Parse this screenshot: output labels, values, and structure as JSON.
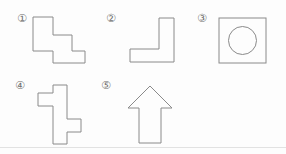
{
  "canvas": {
    "width": 286,
    "height": 154,
    "background_color": "#fdfdfd",
    "stroke_color": "#8a8a8a",
    "label_color": "#6f6f6f"
  },
  "divider": {
    "name": "baseline-rule",
    "y": 147,
    "color": "#e2e2e2"
  },
  "figures": [
    {
      "id": "figure-1",
      "label": "①",
      "label_text": "1",
      "shape_name": "staircase-polygon",
      "description": "Two-step staircase descending to the right",
      "label_x": 17,
      "label_y": 13,
      "origin_x": 33,
      "origin_y": 17,
      "view_width": 56,
      "view_height": 48,
      "points": "0,0 20,0 20,18 39,18 39,34 52,34 52,46 20,46 20,34 0,34"
    },
    {
      "id": "figure-2",
      "label": "②",
      "label_text": "2",
      "shape_name": "l-shape-polygon",
      "description": "L shape: tall vertical bar on the right with a horizontal foot extending left",
      "label_x": 106,
      "label_y": 13,
      "origin_x": 130,
      "origin_y": 18,
      "view_width": 48,
      "view_height": 46,
      "points": "29,0 44,0 44,44 0,44 0,31 29,31"
    },
    {
      "id": "figure-3",
      "label": "③",
      "label_text": "3",
      "shape_name": "square-with-circle",
      "description": "Square outline containing a centered circle",
      "label_x": 197,
      "label_y": 13,
      "origin_x": 219,
      "origin_y": 18,
      "view_width": 48,
      "view_height": 46,
      "square": {
        "x": 0,
        "y": 0,
        "width": 47,
        "height": 45
      },
      "circle": {
        "cx": 23.5,
        "cy": 22.5,
        "r": 14
      }
    },
    {
      "id": "figure-4",
      "label": "④",
      "label_text": "4",
      "shape_name": "offset-cross-polygon",
      "description": "Cross-like polygon with an arm on the upper left and an arm on the lower right",
      "label_x": 15,
      "label_y": 80,
      "origin_x": 38,
      "origin_y": 85,
      "view_width": 44,
      "view_height": 60,
      "points": "15,0 29,0 29,34 43,34 43,47 29,47 29,59 15,59 15,21 0,21 0,8 15,8"
    },
    {
      "id": "figure-5",
      "label": "⑤",
      "label_text": "5",
      "shape_name": "up-arrow-polygon",
      "description": "Upward pointing arrow with triangular head and rectangular shaft",
      "label_x": 101,
      "label_y": 80,
      "origin_x": 127,
      "origin_y": 86,
      "view_width": 46,
      "view_height": 58,
      "points": "23,0 45,22 34,22 34,57 12,57 12,22 1,22"
    }
  ]
}
